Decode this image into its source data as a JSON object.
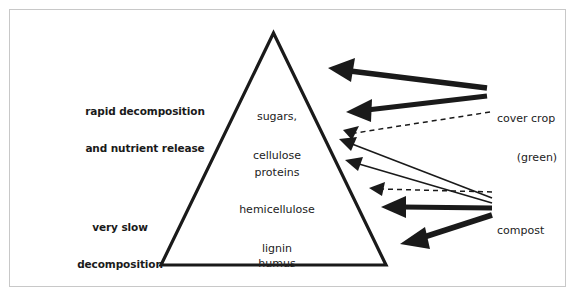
{
  "diagram": {
    "type": "pyramid-flow-diagram",
    "border_color": "#c8c8c8",
    "line_color": "#1a1a1a",
    "background": "#ffffff"
  },
  "side_labels": [
    {
      "id": "rapid",
      "line1": "rapid decomposition",
      "line2": "and nutrient release"
    },
    {
      "id": "slow",
      "line1": "very slow",
      "line2": "decomposition"
    }
  ],
  "pyramid": {
    "name": "decomposition-pyramid",
    "layers": [
      {
        "id": "sugars",
        "line1": "sugars,",
        "line2": "cellulose"
      },
      {
        "id": "proteins",
        "line1": "proteins",
        "line2": ""
      },
      {
        "id": "hemicellulose",
        "line1": "hemicellulose",
        "line2": "lignin"
      },
      {
        "id": "humus",
        "line1": "humus",
        "line2": ""
      }
    ]
  },
  "sources": [
    {
      "id": "cover-crop",
      "line1": "cover crop",
      "line2": "(green)"
    },
    {
      "id": "compost",
      "line1": "compost",
      "line2": ""
    }
  ]
}
